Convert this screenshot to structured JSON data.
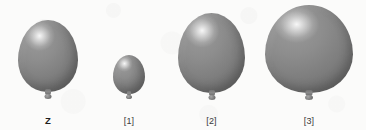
{
  "figure": {
    "kind": "balloon-size-comparison-illustration",
    "background_color": "#fbfbfa",
    "balloon_color": "#7e7e7e",
    "balloon_highlight_color": "#ffffff",
    "label_color": "#3a3a3a",
    "baseline_y": 100
  },
  "balloons": [
    {
      "id": "balloon-z",
      "label": "Z",
      "label_bold": true,
      "center_x": 48,
      "width": 60,
      "height": 72,
      "top": 20,
      "bottom": 92
    },
    {
      "id": "balloon-1",
      "label": "[1]",
      "label_bold": false,
      "center_x": 129,
      "width": 32,
      "height": 39,
      "top": 55,
      "bottom": 94
    },
    {
      "id": "balloon-2",
      "label": "[2]",
      "label_bold": false,
      "center_x": 211,
      "width": 67,
      "height": 80,
      "top": 13,
      "bottom": 93
    },
    {
      "id": "balloon-3",
      "label": "[3]",
      "label_bold": false,
      "center_x": 309,
      "width": 88,
      "height": 88,
      "top": 5,
      "bottom": 93
    }
  ]
}
